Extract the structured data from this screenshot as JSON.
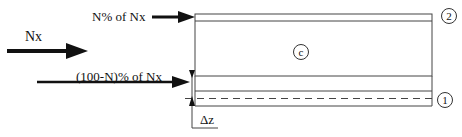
{
  "diagram": {
    "labels": {
      "top_force": "N% of Nx",
      "main_force": "Nx",
      "bottom_force": "(100-N)% of Nx",
      "offset": "Δz"
    },
    "layer_markers": {
      "top": "2",
      "core": "c",
      "bottom": "1"
    }
  }
}
